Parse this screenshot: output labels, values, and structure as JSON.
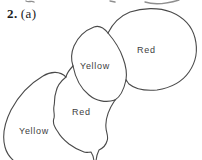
{
  "colors": {
    "ink": "#4a4a4a",
    "artifact": "#8f8f8f",
    "label_text": "#3e3e3e",
    "background": "#ffffff"
  },
  "figure": {
    "exercise_number": "2.",
    "part_label": "(a)",
    "regions": [
      {
        "id": "top-right",
        "label": "Red"
      },
      {
        "id": "middle",
        "label": "Yellow"
      },
      {
        "id": "lower-middle",
        "label": "Red"
      },
      {
        "id": "bottom-left",
        "label": "Yellow"
      }
    ]
  }
}
